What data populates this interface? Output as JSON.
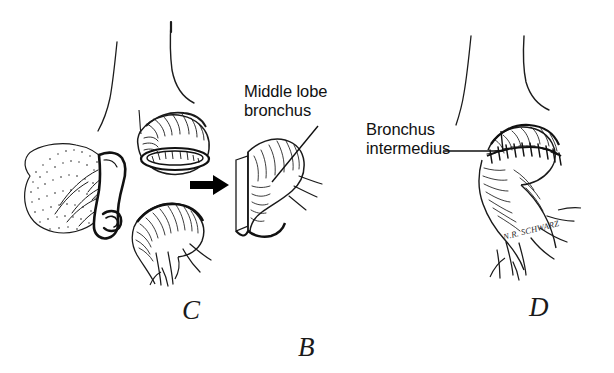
{
  "figure": {
    "overall_panel_letter": "B",
    "background_color": "#ffffff",
    "ink_color": "#000000",
    "width": 614,
    "height": 373
  },
  "labels": [
    {
      "id": "middle-lobe-bronchus",
      "line1": "Middle lobe",
      "line2": "bronchus",
      "text": "Middle lobe bronchus"
    },
    {
      "id": "bronchus-intermedius",
      "line1": "Bronchus",
      "line2": "intermedius",
      "text": "Bronchus intermedius"
    }
  ],
  "panels": [
    {
      "id": "panel-c",
      "letter": "C"
    },
    {
      "id": "panel-d",
      "letter": "D"
    }
  ],
  "signature": {
    "artist": "N.R. SCHWARZ"
  },
  "structures": {
    "resected_specimen": "resected lung specimen with stippled parenchyma",
    "upper_stump": "upper bronchial stump with open lumen",
    "lower_stump": "lower bronchial stump with branching divisions",
    "middle_lobe_segment": "excised middle lobe bronchus segment",
    "arrow": "transfer arrow pointing right",
    "anastomosis": "completed end-to-end anastomosis with interrupted sutures",
    "trachea_outline": "thin trachea and mainstem bronchus outlines"
  }
}
